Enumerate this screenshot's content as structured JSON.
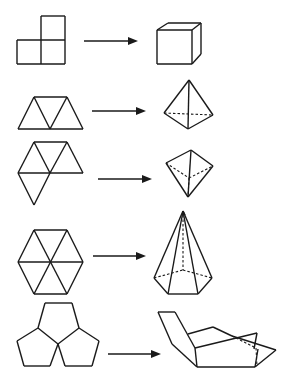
{
  "diagram": {
    "title": "Nets folding into 3D solids",
    "colors": {
      "stroke": "#1a1a1a",
      "background": "#ffffff"
    },
    "rows": [
      {
        "id": "cube",
        "net_label": "three-square-net",
        "solid_label": "cube",
        "net_lines": [
          [
            41,
            16,
            65,
            16
          ],
          [
            65,
            16,
            65,
            64
          ],
          [
            17,
            40,
            65,
            40
          ],
          [
            17,
            40,
            17,
            64
          ],
          [
            17,
            64,
            65,
            64
          ],
          [
            41,
            40,
            41,
            64
          ],
          [
            41,
            16,
            41,
            40
          ]
        ],
        "arrow": [
          84,
          41,
          138,
          41
        ],
        "solid_lines": [
          [
            157,
            30,
            192,
            30
          ],
          [
            192,
            30,
            192,
            64
          ],
          [
            192,
            64,
            157,
            64
          ],
          [
            157,
            64,
            157,
            30
          ],
          [
            157,
            30,
            168,
            23
          ],
          [
            168,
            23,
            201,
            23
          ],
          [
            201,
            23,
            192,
            30
          ],
          [
            201,
            23,
            201,
            54
          ],
          [
            201,
            54,
            192,
            64
          ]
        ],
        "solid_dashes": []
      },
      {
        "id": "tetrahedron",
        "net_label": "four-triangle-strip-net",
        "solid_label": "tetrahedron",
        "net_lines": [
          [
            18,
            129,
            83,
            129
          ],
          [
            34,
            97,
            67,
            97
          ],
          [
            18,
            129,
            34,
            97
          ],
          [
            34,
            97,
            50,
            129
          ],
          [
            50,
            129,
            67,
            97
          ],
          [
            67,
            97,
            83,
            129
          ]
        ],
        "arrow": [
          92,
          111,
          146,
          111
        ],
        "solid_lines": [
          [
            189,
            80,
            164,
            113
          ],
          [
            189,
            80,
            188,
            129
          ],
          [
            189,
            80,
            213,
            115
          ],
          [
            164,
            113,
            188,
            129
          ],
          [
            188,
            129,
            213,
            115
          ]
        ],
        "solid_dashes": [
          [
            164,
            113,
            213,
            115
          ]
        ]
      },
      {
        "id": "triangular-pyramid",
        "net_label": "four-triangle-fan-net",
        "solid_label": "triangular-pyramid",
        "net_lines": [
          [
            34,
            142,
            67,
            142
          ],
          [
            18,
            173,
            83,
            173
          ],
          [
            34,
            142,
            18,
            173
          ],
          [
            34,
            142,
            50,
            173
          ],
          [
            67,
            142,
            50,
            173
          ],
          [
            67,
            142,
            83,
            173
          ],
          [
            18,
            173,
            34,
            205
          ],
          [
            34,
            205,
            50,
            173
          ]
        ],
        "arrow": [
          98,
          179,
          152,
          179
        ],
        "solid_lines": [
          [
            191,
            150,
            166,
            163
          ],
          [
            191,
            150,
            213,
            166
          ],
          [
            191,
            150,
            188,
            197
          ],
          [
            166,
            163,
            188,
            197
          ],
          [
            213,
            166,
            188,
            197
          ]
        ],
        "solid_dashes": [
          [
            166,
            163,
            189,
            178
          ],
          [
            189,
            178,
            213,
            166
          ],
          [
            189,
            178,
            188,
            197
          ]
        ]
      },
      {
        "id": "hexagonal-pyramid",
        "net_label": "six-triangle-hexagon-net",
        "solid_label": "hexagonal-pyramid",
        "net_lines": [
          [
            34,
            230,
            67,
            230
          ],
          [
            67,
            230,
            83,
            262
          ],
          [
            83,
            262,
            67,
            294
          ],
          [
            67,
            294,
            34,
            294
          ],
          [
            34,
            294,
            18,
            262
          ],
          [
            18,
            262,
            34,
            230
          ],
          [
            34,
            230,
            67,
            294
          ],
          [
            67,
            230,
            34,
            294
          ],
          [
            18,
            262,
            83,
            262
          ]
        ],
        "arrow": [
          93,
          256,
          146,
          256
        ],
        "solid_lines": [
          [
            183,
            211,
            154,
            278
          ],
          [
            183,
            211,
            168,
            294
          ],
          [
            183,
            211,
            198,
            294
          ],
          [
            183,
            211,
            212,
            278
          ],
          [
            154,
            278,
            168,
            294
          ],
          [
            168,
            294,
            198,
            294
          ],
          [
            198,
            294,
            212,
            278
          ],
          [
            183,
            211,
            185,
            215
          ]
        ],
        "solid_dashes": [
          [
            183,
            215,
            183,
            270
          ],
          [
            154,
            278,
            183,
            270
          ],
          [
            183,
            270,
            212,
            278
          ]
        ]
      },
      {
        "id": "dodecahedron-partial",
        "net_label": "three-pentagon-net",
        "solid_label": "partial-dodecahedron",
        "net_lines": [
          [
            45,
            303,
            72,
            303
          ],
          [
            72,
            303,
            79,
            328
          ],
          [
            79,
            328,
            58,
            344
          ],
          [
            58,
            344,
            38,
            328
          ],
          [
            38,
            328,
            45,
            303
          ],
          [
            38,
            328,
            17,
            341
          ],
          [
            17,
            341,
            24,
            366
          ],
          [
            24,
            366,
            50,
            366
          ],
          [
            50,
            366,
            58,
            344
          ],
          [
            79,
            328,
            99,
            341
          ],
          [
            99,
            341,
            92,
            366
          ],
          [
            92,
            366,
            65,
            366
          ],
          [
            65,
            366,
            58,
            344
          ]
        ],
        "arrow": [
          108,
          354,
          161,
          354
        ],
        "solid_lines": [
          [
            158,
            312,
            175,
            312
          ],
          [
            175,
            312,
            195,
            348
          ],
          [
            158,
            312,
            172,
            344
          ],
          [
            172,
            344,
            197,
            367
          ],
          [
            197,
            367,
            195,
            348
          ],
          [
            197,
            367,
            255,
            367
          ],
          [
            255,
            367,
            258,
            349
          ],
          [
            195,
            348,
            257,
            333
          ],
          [
            257,
            333,
            254,
            349
          ],
          [
            188,
            334,
            213,
            327
          ],
          [
            213,
            327,
            232,
            336
          ],
          [
            232,
            336,
            276,
            350
          ],
          [
            276,
            350,
            255,
            367
          ]
        ],
        "solid_dashes": [
          [
            232,
            336,
            256,
            348
          ],
          [
            256,
            348,
            257,
            366
          ]
        ]
      }
    ]
  }
}
